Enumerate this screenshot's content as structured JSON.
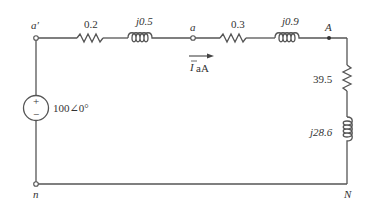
{
  "diagram": {
    "type": "single-phase equivalent circuit",
    "nodes": {
      "a_prime": "a′",
      "a": "a",
      "A": "A",
      "n": "n",
      "N": "N"
    },
    "source": {
      "value": "100∠0°",
      "plus": "+",
      "minus": "−"
    },
    "line_source_side": {
      "resistance": "0.2",
      "reactance": "j0.5"
    },
    "line_load_side": {
      "resistance": "0.3",
      "reactance": "j0.9"
    },
    "load": {
      "resistance": "39.5",
      "reactance": "j28.6"
    },
    "current": {
      "symbol": "I",
      "subscript": "aA"
    }
  }
}
